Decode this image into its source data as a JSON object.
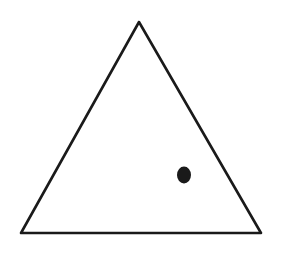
{
  "figure": {
    "width": 285,
    "height": 253,
    "background": "#ffffff",
    "stroke_color": "#1a1a1a",
    "shapes": {
      "triangle": {
        "points": [
          [
            139,
            22
          ],
          [
            21,
            233
          ],
          [
            261,
            233
          ]
        ],
        "stroke_width": 2.6
      },
      "dot": {
        "cx": 184,
        "cy": 175,
        "rx": 7,
        "ry": 8.5,
        "fill": "#1a1a1a"
      }
    }
  }
}
